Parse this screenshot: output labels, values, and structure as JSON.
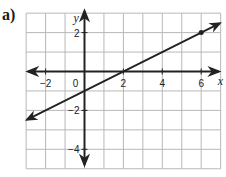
{
  "part_label": "a)",
  "graph": {
    "x_axis_name": "x",
    "y_axis_name": "y",
    "x_ticks": [
      {
        "value": -2,
        "label": "−2"
      },
      {
        "value": 0,
        "label": "0"
      },
      {
        "value": 2,
        "label": "2"
      },
      {
        "value": 4,
        "label": "4"
      },
      {
        "value": 6,
        "label": "6"
      }
    ],
    "y_ticks": [
      {
        "value": 2,
        "label": "2"
      },
      {
        "value": -2,
        "label": "−2"
      },
      {
        "value": -4,
        "label": "−4"
      }
    ],
    "x_range": [
      -3,
      7
    ],
    "y_range": [
      -5,
      3
    ],
    "line": {
      "slope": 0.5,
      "intercept": -1,
      "through": [
        [
          0,
          -1
        ],
        [
          2,
          0
        ]
      ]
    },
    "marked_point": [
      6,
      2
    ],
    "colors": {
      "grid": "#b8b8b8",
      "axis": "#222222",
      "line": "#222222"
    }
  }
}
